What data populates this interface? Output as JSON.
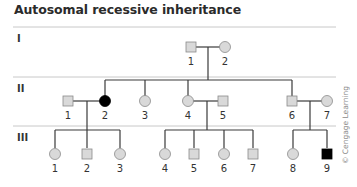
{
  "title": "Autosomal recessive inheritance",
  "copyright": "© Cengage Learning",
  "colors": {
    "unaffected_fill": "#d9d9d9",
    "affected_fill": "#000000",
    "line": "#3a3a3a",
    "separator": "#c8c8c8"
  },
  "generations": [
    {
      "label": "I",
      "individuals": [
        {
          "id": "1",
          "sex": "male",
          "affected": false
        },
        {
          "id": "2",
          "sex": "female",
          "affected": false
        }
      ]
    },
    {
      "label": "II",
      "individuals": [
        {
          "id": "1",
          "sex": "male",
          "affected": false
        },
        {
          "id": "2",
          "sex": "female",
          "affected": true
        },
        {
          "id": "3",
          "sex": "female",
          "affected": false
        },
        {
          "id": "4",
          "sex": "female",
          "affected": false
        },
        {
          "id": "5",
          "sex": "male",
          "affected": false
        },
        {
          "id": "6",
          "sex": "male",
          "affected": false
        },
        {
          "id": "7",
          "sex": "female",
          "affected": false
        }
      ]
    },
    {
      "label": "III",
      "individuals": [
        {
          "id": "1",
          "sex": "female",
          "affected": false
        },
        {
          "id": "2",
          "sex": "male",
          "affected": false
        },
        {
          "id": "3",
          "sex": "female",
          "affected": false
        },
        {
          "id": "4",
          "sex": "female",
          "affected": false
        },
        {
          "id": "5",
          "sex": "male",
          "affected": false
        },
        {
          "id": "6",
          "sex": "female",
          "affected": false
        },
        {
          "id": "7",
          "sex": "male",
          "affected": false
        },
        {
          "id": "8",
          "sex": "female",
          "affected": false
        },
        {
          "id": "9",
          "sex": "male",
          "affected": true
        }
      ]
    }
  ]
}
